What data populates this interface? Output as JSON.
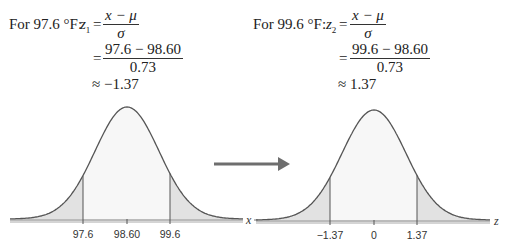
{
  "left_equation": {
    "lead": "For 97.6 °F:",
    "var": "z",
    "sub": "1",
    "formula_num": "x − μ",
    "formula_den": "σ",
    "sub_num": "97.6 − 98.60",
    "sub_den": "0.73",
    "result": "≈ −1.37",
    "eq_sign": "="
  },
  "right_equation": {
    "lead": "For 99.6 °F:",
    "var": "z",
    "sub": "2",
    "formula_num": "x − μ",
    "formula_den": "σ",
    "sub_num": "99.6 − 98.60",
    "sub_den": "0.73",
    "result": "≈ 1.37",
    "eq_sign": "="
  },
  "colors": {
    "curve": "#555555",
    "tail_fill": "#e4e4e4",
    "body_fill": "#f7f7f7",
    "arrow": "#6e6e6e",
    "axis": "#666666"
  },
  "chart_data": [
    {
      "type": "area",
      "title": "Normal distribution of body temperature (°F)",
      "xlabel": "x",
      "mean": 98.6,
      "sd": 0.73,
      "tick_labels": [
        "97.6",
        "98.60",
        "99.6"
      ],
      "ticks": [
        97.6,
        98.6,
        99.6
      ],
      "shaded_regions": [
        "x < 97.6",
        "x > 99.6"
      ],
      "grid": false
    },
    {
      "type": "area",
      "title": "Standard normal distribution",
      "xlabel": "z",
      "mean": 0,
      "sd": 1,
      "tick_labels": [
        "−1.37",
        "0",
        "1.37"
      ],
      "ticks": [
        -1.37,
        0,
        1.37
      ],
      "shaded_regions": [
        "z < −1.37",
        "z > 1.37"
      ],
      "grid": false
    }
  ],
  "arrow": {
    "direction": "right",
    "meaning": "transform x to z"
  }
}
